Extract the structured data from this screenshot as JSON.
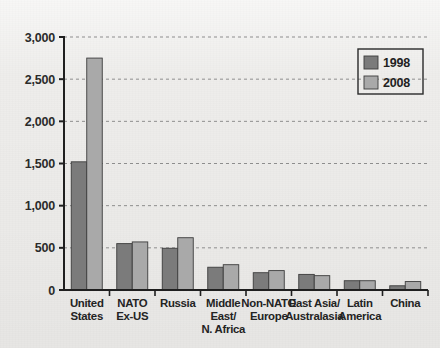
{
  "chart_data": {
    "type": "bar",
    "title": "",
    "subtitle": "",
    "xlabel": "",
    "ylabel": "",
    "ylim": [
      0,
      3000
    ],
    "ytick_labels": [
      "0",
      "500",
      "1,000",
      "1,500",
      "2,000",
      "2,500",
      "3,000"
    ],
    "ytick_values": [
      0,
      500,
      1000,
      1500,
      2000,
      2500,
      3000
    ],
    "grid": true,
    "grid_axis": "y",
    "legend_position": "top-right",
    "categories": [
      "United States",
      "NATO Ex-US",
      "Russia",
      "Middle East/ N. Africa",
      "Non-NATO Europe",
      "East Asia/ Australasia",
      "Latin America",
      "China"
    ],
    "category_lines": [
      [
        "United",
        "States"
      ],
      [
        "NATO",
        "Ex-US"
      ],
      [
        "Russia"
      ],
      [
        "Middle",
        "East/",
        "N. Africa"
      ],
      [
        "Non-NATO",
        "Europe"
      ],
      [
        "East Asia/",
        "Australasia"
      ],
      [
        "Latin",
        "America"
      ],
      [
        "China"
      ]
    ],
    "series": [
      {
        "name": "1998",
        "color": "#7b7b7b",
        "values": [
          1520,
          550,
          495,
          270,
          205,
          185,
          110,
          50
        ]
      },
      {
        "name": "2008",
        "color": "#a9a9a9",
        "values": [
          2750,
          570,
          620,
          300,
          230,
          170,
          110,
          100
        ]
      }
    ]
  },
  "legend": {
    "entries": [
      {
        "label": "1998",
        "swatch": "#7b7b7b"
      },
      {
        "label": "2008",
        "swatch": "#a9a9a9"
      }
    ]
  },
  "colors": {
    "background": "#eeedeb",
    "axis": "#1f1f1f",
    "gridline": "#8d8d8d",
    "bar_1998": "#7b7b7b",
    "bar_2008": "#a9a9a9",
    "bar_stroke": "#3d3d3d",
    "text": "#222222"
  }
}
